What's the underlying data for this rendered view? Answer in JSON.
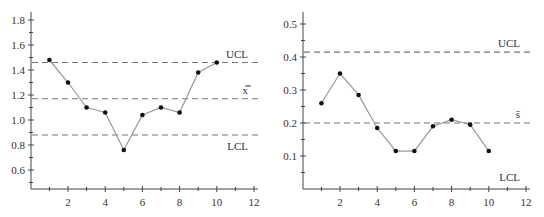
{
  "chart_data": [
    {
      "type": "line",
      "title": "",
      "xlabel": "",
      "ylabel": "",
      "x": [
        1,
        2,
        3,
        4,
        5,
        6,
        7,
        8,
        9,
        10
      ],
      "values": [
        1.48,
        1.3,
        1.1,
        1.06,
        0.76,
        1.04,
        1.1,
        1.06,
        1.38,
        1.46
      ],
      "xlim": [
        0,
        12.2
      ],
      "ylim": [
        0.45,
        1.82
      ],
      "xticks": [
        2,
        4,
        6,
        8,
        10,
        12
      ],
      "xtick_labels": [
        "2",
        "4",
        "6",
        "8",
        "10",
        "12"
      ],
      "yticks": [
        0.6,
        0.8,
        1.0,
        1.2,
        1.4,
        1.6,
        1.8
      ],
      "ytick_labels": [
        "0.6",
        "0.8",
        "1.0",
        "1.2",
        "1.4",
        "1.6",
        "1.8"
      ],
      "reference_lines": [
        {
          "name": "UCL",
          "label": "UCL",
          "value": 1.46
        },
        {
          "name": "center",
          "label": "x̿",
          "value": 1.17
        },
        {
          "name": "LCL",
          "label": "LCL",
          "value": 0.88
        }
      ],
      "grid": false,
      "legend": "none"
    },
    {
      "type": "line",
      "title": "",
      "xlabel": "",
      "ylabel": "",
      "x": [
        1,
        2,
        3,
        4,
        5,
        6,
        7,
        8,
        9,
        10
      ],
      "values": [
        0.26,
        0.35,
        0.285,
        0.185,
        0.115,
        0.115,
        0.19,
        0.21,
        0.195,
        0.115
      ],
      "xlim": [
        0,
        12.2
      ],
      "ylim": [
        0,
        0.52
      ],
      "xticks": [
        2,
        4,
        6,
        8,
        10,
        12
      ],
      "xtick_labels": [
        "2",
        "4",
        "6",
        "8",
        "10",
        "12"
      ],
      "yticks": [
        0.1,
        0.2,
        0.3,
        0.4,
        0.5
      ],
      "ytick_labels": [
        "0.1",
        "0.2",
        "0.3",
        "0.4",
        "0.5"
      ],
      "reference_lines": [
        {
          "name": "UCL",
          "label": "UCL",
          "value": 0.415
        },
        {
          "name": "center",
          "label": "s̄",
          "value": 0.2
        },
        {
          "name": "LCL",
          "label": "LCL",
          "value": 0
        }
      ],
      "grid": false,
      "legend": "none"
    }
  ]
}
